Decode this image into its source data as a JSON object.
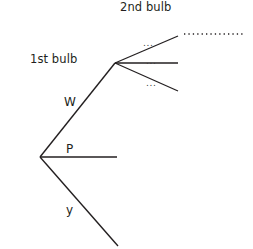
{
  "diagram": {
    "type": "probability-tree",
    "title": "",
    "headings": [
      {
        "id": "first-bulb",
        "text": "1st bulb"
      },
      {
        "id": "second-bulb",
        "text": "2nd bulb"
      }
    ],
    "nodes": [
      {
        "id": "root",
        "x": 40,
        "y": 157
      },
      {
        "id": "node-w",
        "x": 115,
        "y": 63
      }
    ],
    "branches": [
      {
        "id": "branch-w",
        "label": "W",
        "from": "root",
        "to_x": 115,
        "to_y": 63,
        "style": "solid"
      },
      {
        "id": "branch-p",
        "label": "P",
        "from": "root",
        "to_x": 117,
        "to_y": 157,
        "style": "solid"
      },
      {
        "id": "branch-y",
        "label": "y",
        "from": "root",
        "to_x": 118,
        "to_y": 246,
        "style": "solid"
      },
      {
        "id": "branch-w-1",
        "label": "...",
        "from": "node-w",
        "to_x": 178,
        "to_y": 36,
        "style": "solid"
      },
      {
        "id": "branch-w-2",
        "label": "...",
        "from": "node-w",
        "to_x": 178,
        "to_y": 63,
        "style": "solid"
      },
      {
        "id": "branch-w-3",
        "label": "...",
        "from": "node-w",
        "to_x": 178,
        "to_y": 91,
        "style": "solid"
      }
    ],
    "dotted_line": {
      "id": "dotted-continuation",
      "from_x": 184,
      "from_y": 34,
      "to_x": 243,
      "to_y": 34
    },
    "colors": {
      "stroke": "#231f20",
      "text": "#231f20",
      "background": "#ffffff"
    }
  }
}
